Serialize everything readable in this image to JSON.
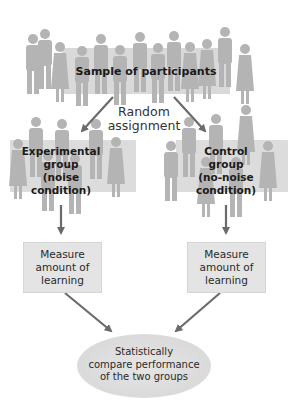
{
  "diagram": {
    "sample": {
      "label": "Sample of participants"
    },
    "random": {
      "line1": "Random",
      "line2": "assignment"
    },
    "experimental": {
      "line1": "Experimental",
      "line2": "group",
      "line3": "(noise",
      "line4": "condition)"
    },
    "control": {
      "line1": "Control",
      "line2": "group",
      "line3": "(no-noise",
      "line4": "condition)"
    },
    "measure_left": {
      "line1": "Measure",
      "line2": "amount of",
      "line3": "learning"
    },
    "measure_right": {
      "line1": "Measure",
      "line2": "amount of",
      "line3": "learning"
    },
    "compare": {
      "line1": "Statistically",
      "line2": "compare performance",
      "line3": "of the two groups"
    }
  },
  "colors": {
    "silhouette": "#b4b4b4",
    "box_bg": "#e4e4e4",
    "arrow": "#6b6b6b",
    "ellipse": "#dcdcdc"
  }
}
